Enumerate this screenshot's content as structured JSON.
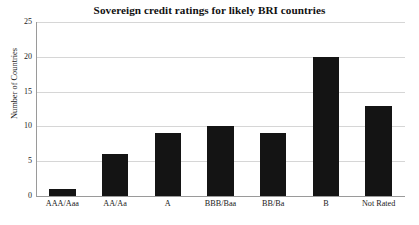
{
  "chart_data": {
    "type": "bar",
    "title": "Sovereign credit ratings for likely BRI countries",
    "xlabel": "",
    "ylabel": "Number of Countries",
    "categories": [
      "AAA/Aaa",
      "AA/Aa",
      "A",
      "BBB/Baa",
      "BB/Ba",
      "B",
      "Not Rated"
    ],
    "values": [
      1,
      6,
      9,
      10,
      9,
      20,
      13
    ],
    "ylim": [
      0,
      25
    ],
    "yticks": [
      0,
      5,
      10,
      15,
      20,
      25
    ],
    "ytick_labels": [
      "0",
      "5",
      "10",
      "15",
      "20",
      "25"
    ],
    "grid": true,
    "legend": null,
    "bar_color": "#141414",
    "gridline_color": "#d6d6d6",
    "axis_color": "#9a9a9a",
    "background_color": "#ffffff"
  }
}
